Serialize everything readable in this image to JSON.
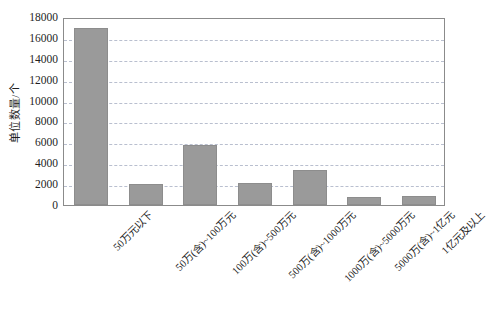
{
  "chart_data": {
    "type": "bar",
    "title": "",
    "subtitle": "",
    "xlabel": "",
    "ylabel": "单位数量/个",
    "ylim": [
      0,
      18000
    ],
    "ytick_step": 2000,
    "yticks": [
      0,
      2000,
      4000,
      6000,
      8000,
      10000,
      12000,
      14000,
      16000,
      18000
    ],
    "ytick_labels": [
      "0",
      "2000",
      "4000",
      "6000",
      "8000",
      "10000",
      "12000",
      "14000",
      "16000",
      "18000"
    ],
    "grid": true,
    "grid_axis": "y",
    "grid_style": "dashed",
    "legend": false,
    "legend_position": "none",
    "bar_color": "#9a9a9a",
    "bar_edge_color": "#8d8d8d",
    "plot_border_color": "#8b8b8b",
    "gridline_color": "#b9bfcf",
    "categories": [
      "50万元以下",
      "50万(含)~100万元",
      "100万(含)~500万元",
      "500万(含)~1000万元",
      "1000万(含)~5000万元",
      "5000万(含)~1亿元",
      "1亿元及以上"
    ],
    "values": [
      16950,
      2050,
      5700,
      2150,
      3400,
      750,
      850
    ],
    "series": [
      {
        "name": "单位数量",
        "values": [
          16950,
          2050,
          5700,
          2150,
          3400,
          750,
          850
        ]
      }
    ]
  }
}
